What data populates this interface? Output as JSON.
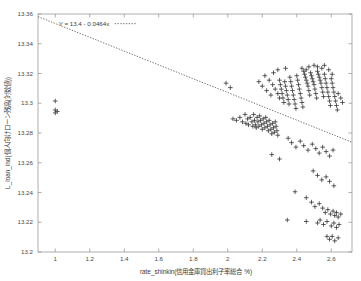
{
  "chart_data": {
    "type": "scatter",
    "title": "",
    "xlabel": "rate_shinkin(信用金庫貸出利子率総合  %)",
    "ylabel": "L_loan_ind(個人向けローン残高(対数値))",
    "xlim": [
      0.9,
      2.72
    ],
    "ylim": [
      13.2,
      13.36
    ],
    "xticks": [
      1,
      1.2,
      1.4,
      1.6,
      1.8,
      2,
      2.2,
      2.4,
      2.6
    ],
    "xtick_labels": [
      "1",
      "1.2",
      "1.4",
      "1.6",
      "1.8",
      "2",
      "2.2",
      "2.4",
      "2.6"
    ],
    "yticks": [
      13.2,
      13.22,
      13.24,
      13.26,
      13.28,
      13.3,
      13.32,
      13.34,
      13.36
    ],
    "ytick_labels": [
      "13.2",
      "13.22",
      "13.24",
      "13.26",
      "13.28",
      "13.3",
      "13.32",
      "13.34",
      "13.36"
    ],
    "grid": false,
    "legend_position": "top-left-inside",
    "marker": "plus",
    "marker_color": "#2b2b2b",
    "frame_color": "#9a9a9a",
    "annotations": [
      {
        "name": "regression-equation",
        "text": "Y = 13.4 - 0.0464x",
        "x": 1.02,
        "y": 13.3535,
        "line_style": "dotted"
      }
    ],
    "fit_line": {
      "name": "ols-fit",
      "label": "Y = 13.4 - 0.0464x",
      "intercept": 13.4,
      "slope": -0.0464,
      "style": "dotted",
      "color": "#555555",
      "x_start": 0.9,
      "x_end": 2.72
    },
    "series": [
      {
        "name": "observations",
        "points": [
          [
            1.0,
            13.3015
          ],
          [
            1.0,
            13.2955
          ],
          [
            1.0,
            13.2935
          ],
          [
            1.012,
            13.2945
          ],
          [
            2.03,
            13.2895
          ],
          [
            2.05,
            13.2885
          ],
          [
            2.07,
            13.2905
          ],
          [
            2.085,
            13.2875
          ],
          [
            2.1,
            13.2925
          ],
          [
            2.105,
            13.2865
          ],
          [
            2.115,
            13.2895
          ],
          [
            2.12,
            13.2855
          ],
          [
            2.13,
            13.2905
          ],
          [
            2.14,
            13.2875
          ],
          [
            2.145,
            13.2845
          ],
          [
            2.15,
            13.2925
          ],
          [
            2.155,
            13.2885
          ],
          [
            2.16,
            13.2855
          ],
          [
            2.165,
            13.2835
          ],
          [
            2.17,
            13.2905
          ],
          [
            2.175,
            13.2875
          ],
          [
            2.18,
            13.2845
          ],
          [
            2.185,
            13.2915
          ],
          [
            2.19,
            13.2885
          ],
          [
            2.195,
            13.2855
          ],
          [
            2.2,
            13.2825
          ],
          [
            2.205,
            13.2895
          ],
          [
            2.21,
            13.2865
          ],
          [
            2.215,
            13.2835
          ],
          [
            2.22,
            13.2905
          ],
          [
            2.225,
            13.2875
          ],
          [
            2.23,
            13.2845
          ],
          [
            2.235,
            13.2815
          ],
          [
            2.24,
            13.2885
          ],
          [
            2.245,
            13.2855
          ],
          [
            2.25,
            13.2825
          ],
          [
            2.255,
            13.2795
          ],
          [
            2.26,
            13.2865
          ],
          [
            2.265,
            13.2835
          ],
          [
            2.27,
            13.2805
          ],
          [
            2.275,
            13.2875
          ],
          [
            2.28,
            13.2845
          ],
          [
            2.285,
            13.2815
          ],
          [
            2.29,
            13.2785
          ],
          [
            2.18,
            13.3145
          ],
          [
            2.2,
            13.3115
          ],
          [
            2.225,
            13.3085
          ],
          [
            2.25,
            13.3055
          ],
          [
            2.26,
            13.3125
          ],
          [
            2.275,
            13.3095
          ],
          [
            2.29,
            13.3065
          ],
          [
            2.3,
            13.3035
          ],
          [
            2.3,
            13.3155
          ],
          [
            2.305,
            13.3125
          ],
          [
            2.31,
            13.3095
          ],
          [
            2.315,
            13.3065
          ],
          [
            2.32,
            13.3035
          ],
          [
            2.325,
            13.3005
          ],
          [
            2.33,
            13.3145
          ],
          [
            2.335,
            13.3115
          ],
          [
            2.34,
            13.3085
          ],
          [
            2.345,
            13.3055
          ],
          [
            2.35,
            13.3025
          ],
          [
            2.355,
            13.2995
          ],
          [
            2.36,
            13.3175
          ],
          [
            2.365,
            13.3145
          ],
          [
            2.37,
            13.3115
          ],
          [
            2.375,
            13.3085
          ],
          [
            2.38,
            13.3055
          ],
          [
            2.385,
            13.3025
          ],
          [
            2.39,
            13.2995
          ],
          [
            2.395,
            13.2965
          ],
          [
            2.4,
            13.3185
          ],
          [
            2.405,
            13.3155
          ],
          [
            2.41,
            13.3125
          ],
          [
            2.415,
            13.3095
          ],
          [
            2.42,
            13.3065
          ],
          [
            2.425,
            13.3035
          ],
          [
            2.43,
            13.3005
          ],
          [
            2.435,
            13.2975
          ],
          [
            2.44,
            13.3215
          ],
          [
            2.445,
            13.3195
          ],
          [
            2.45,
            13.3175
          ],
          [
            2.455,
            13.3155
          ],
          [
            2.46,
            13.3135
          ],
          [
            2.465,
            13.3115
          ],
          [
            2.47,
            13.3085
          ],
          [
            2.475,
            13.3055
          ],
          [
            2.48,
            13.3205
          ],
          [
            2.485,
            13.3185
          ],
          [
            2.49,
            13.3165
          ],
          [
            2.495,
            13.3145
          ],
          [
            2.5,
            13.3125
          ],
          [
            2.505,
            13.3095
          ],
          [
            2.51,
            13.3065
          ],
          [
            2.515,
            13.3035
          ],
          [
            2.52,
            13.3215
          ],
          [
            2.525,
            13.3195
          ],
          [
            2.53,
            13.3175
          ],
          [
            2.535,
            13.3155
          ],
          [
            2.54,
            13.3135
          ],
          [
            2.545,
            13.3105
          ],
          [
            2.55,
            13.3075
          ],
          [
            2.555,
            13.3045
          ],
          [
            2.56,
            13.3195
          ],
          [
            2.565,
            13.3165
          ],
          [
            2.57,
            13.3135
          ],
          [
            2.575,
            13.3105
          ],
          [
            2.58,
            13.3075
          ],
          [
            2.585,
            13.3045
          ],
          [
            2.59,
            13.3015
          ],
          [
            2.595,
            13.2985
          ],
          [
            2.6,
            13.3165
          ],
          [
            2.605,
            13.3135
          ],
          [
            2.61,
            13.3105
          ],
          [
            2.615,
            13.3075
          ],
          [
            2.62,
            13.3045
          ],
          [
            2.625,
            13.3015
          ],
          [
            2.63,
            13.2985
          ],
          [
            2.635,
            13.2955
          ],
          [
            2.29,
            13.3225
          ],
          [
            2.335,
            13.3235
          ],
          [
            2.47,
            13.3245
          ],
          [
            2.5,
            13.3255
          ],
          [
            2.545,
            13.3235
          ],
          [
            2.56,
            13.3255
          ],
          [
            2.585,
            13.3225
          ],
          [
            2.605,
            13.3195
          ],
          [
            2.43,
            13.3235
          ],
          [
            2.455,
            13.3225
          ],
          [
            2.52,
            13.3245
          ],
          [
            2.35,
            13.2765
          ],
          [
            2.37,
            13.2735
          ],
          [
            2.395,
            13.2705
          ],
          [
            2.42,
            13.2745
          ],
          [
            2.44,
            13.2715
          ],
          [
            2.465,
            13.2685
          ],
          [
            2.49,
            13.2725
          ],
          [
            2.51,
            13.2695
          ],
          [
            2.53,
            13.2665
          ],
          [
            2.55,
            13.2705
          ],
          [
            2.57,
            13.2675
          ],
          [
            2.59,
            13.2645
          ],
          [
            2.61,
            13.2685
          ],
          [
            2.255,
            13.2655
          ],
          [
            2.3,
            13.2625
          ],
          [
            2.495,
            13.2545
          ],
          [
            2.52,
            13.2515
          ],
          [
            2.545,
            13.2485
          ],
          [
            2.57,
            13.2505
          ],
          [
            2.59,
            13.2475
          ],
          [
            2.615,
            13.2445
          ],
          [
            2.39,
            13.2405
          ],
          [
            2.455,
            13.2365
          ],
          [
            2.485,
            13.2335
          ],
          [
            2.505,
            13.2305
          ],
          [
            2.53,
            13.2325
          ],
          [
            2.55,
            13.2295
          ],
          [
            2.565,
            13.2265
          ],
          [
            2.58,
            13.2285
          ],
          [
            2.595,
            13.2255
          ],
          [
            2.61,
            13.2275
          ],
          [
            2.62,
            13.2245
          ],
          [
            2.63,
            13.2265
          ],
          [
            2.64,
            13.2235
          ],
          [
            2.655,
            13.2255
          ],
          [
            2.345,
            13.2215
          ],
          [
            2.455,
            13.2205
          ],
          [
            2.52,
            13.2195
          ],
          [
            2.535,
            13.2215
          ],
          [
            2.555,
            13.2185
          ],
          [
            2.575,
            13.2205
          ],
          [
            2.6,
            13.2175
          ],
          [
            2.615,
            13.2195
          ],
          [
            2.63,
            13.2165
          ],
          [
            2.645,
            13.2185
          ],
          [
            2.575,
            13.2105
          ],
          [
            2.59,
            13.2085
          ],
          [
            2.605,
            13.2105
          ],
          [
            2.62,
            13.2075
          ],
          [
            2.64,
            13.2095
          ],
          [
            2.64,
            13.3065
          ],
          [
            2.655,
            13.3035
          ],
          [
            2.665,
            13.3005
          ],
          [
            2.215,
            13.3185
          ],
          [
            2.24,
            13.3155
          ],
          [
            2.265,
            13.3205
          ],
          [
            1.99,
            13.3135
          ],
          [
            2.015,
            13.3105
          ]
        ]
      }
    ]
  },
  "axes": {
    "x_title": "rate_shinkin(信用金庫貸出利子率総合  %)",
    "y_title": "L_loan_ind(個人向けローン残高(対数値))"
  },
  "equation": {
    "label": "Y = 13.4 - 0.0464x"
  }
}
